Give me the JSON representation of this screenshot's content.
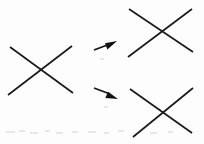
{
  "figure": {
    "background_color": "#fdfdfd",
    "ink_color": "#1a1a1a",
    "width": 204,
    "height": 144
  },
  "chart_data": {
    "type": "diagram",
    "xlabel": "",
    "ylabel": "",
    "xlim": [
      0,
      204
    ],
    "ylim": [
      0,
      144
    ],
    "grid": false,
    "legend": "none",
    "nodes": [
      {
        "id": "source-x",
        "label": "source X",
        "role": "input",
        "center": [
          42,
          70
        ],
        "strokes": [
          {
            "name": "descending",
            "x1": 10,
            "y1": 47,
            "x2": 73,
            "y2": 93
          },
          {
            "name": "ascending",
            "x1": 8,
            "y1": 95,
            "x2": 72,
            "y2": 46
          }
        ]
      },
      {
        "id": "result-x-upper",
        "label": "rotated X upper",
        "role": "output",
        "center": [
          166,
          32
        ],
        "strokes": [
          {
            "name": "descending",
            "x1": 129,
            "y1": 9,
            "x2": 193,
            "y2": 52
          },
          {
            "name": "ascending",
            "x1": 128,
            "y1": 57,
            "x2": 192,
            "y2": 9
          }
        ]
      },
      {
        "id": "result-x-lower",
        "label": "rotated X lower",
        "role": "output",
        "center": [
          155,
          110
        ],
        "strokes": [
          {
            "name": "descending",
            "x1": 130,
            "y1": 89,
            "x2": 192,
            "y2": 133
          },
          {
            "name": "ascending",
            "x1": 133,
            "y1": 137,
            "x2": 193,
            "y2": 88
          }
        ]
      }
    ],
    "edges": [
      {
        "id": "arrow-upper",
        "from": "source-x",
        "to": "result-x-upper",
        "label": "",
        "direction": "up-right",
        "shaft": {
          "x1": 94,
          "y1": 50,
          "x2": 110,
          "y2": 44
        },
        "head_tip": [
          117,
          41
        ]
      },
      {
        "id": "arrow-lower",
        "from": "source-x",
        "to": "result-x-lower",
        "label": "",
        "direction": "down-right",
        "shaft": {
          "x1": 94,
          "y1": 88,
          "x2": 110,
          "y2": 94
        },
        "head_tip": [
          118,
          99
        ]
      }
    ]
  }
}
